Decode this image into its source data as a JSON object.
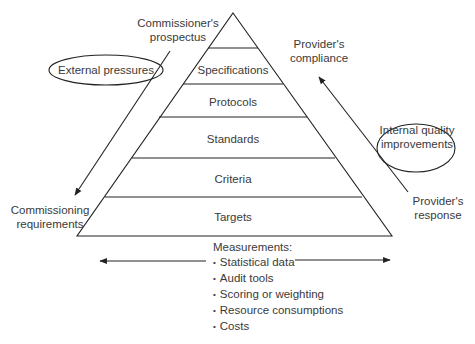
{
  "diagram": {
    "type": "pyramid",
    "tiers_top_to_bottom": [
      {
        "label": ""
      },
      {
        "label": "Specifications"
      },
      {
        "label": "Protocols"
      },
      {
        "label": "Standards"
      },
      {
        "label": "Criteria"
      },
      {
        "label": "Targets"
      }
    ],
    "left_side": {
      "top_label": "Commissioner's prospectus",
      "top_label_lines": [
        "Commissioner's",
        "prospectus"
      ],
      "oval_label": "External pressures",
      "bottom_label_lines": [
        "Commissioning",
        "requirements"
      ],
      "arrow_direction": "down"
    },
    "right_side": {
      "top_label_lines": [
        "Provider's",
        "compliance"
      ],
      "oval_label_lines": [
        "Internal quality",
        "improvements"
      ],
      "bottom_label_lines": [
        "Provider's",
        "response"
      ],
      "arrow_direction": "up"
    },
    "measurements": {
      "title": "Measurements:",
      "items": [
        "Statistical data",
        "Audit tools",
        "Scoring or weighting",
        "Resource consumptions",
        "Costs"
      ],
      "arrow": "double-headed horizontal"
    }
  }
}
